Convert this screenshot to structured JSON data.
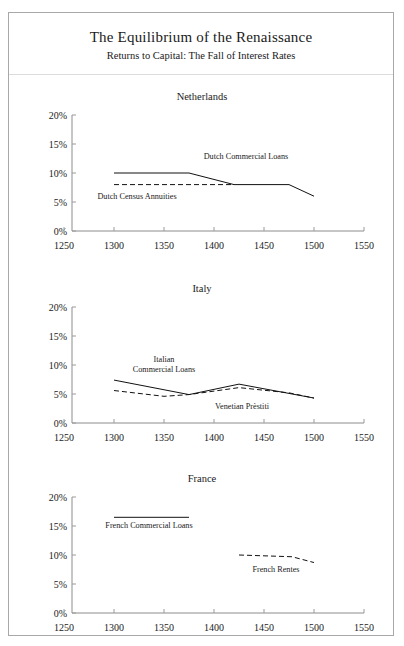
{
  "document": {
    "main_title": "The Equilibrium of the Renaissance",
    "sub_title": "Returns to Capital: The Fall of Interest Rates"
  },
  "axes": {
    "x_ticks": [
      "1250",
      "1300",
      "1350",
      "1400",
      "1450",
      "1500",
      "1550"
    ],
    "y_ticks": [
      "0%",
      "5%",
      "10%",
      "15%",
      "20%"
    ]
  },
  "chart_data": [
    {
      "type": "line",
      "title": "Netherlands",
      "xlabel": "",
      "ylabel": "",
      "xlim": [
        1250,
        1550
      ],
      "ylim": [
        0,
        20
      ],
      "xticks": [
        1250,
        1300,
        1350,
        1400,
        1450,
        1500,
        1550
      ],
      "yticks": [
        0,
        5,
        10,
        15,
        20
      ],
      "xticklabels": [
        "1250",
        "1300",
        "1350",
        "1400",
        "1450",
        "1500",
        "1550"
      ],
      "yticklabels": [
        "0%",
        "5%",
        "10%",
        "15%",
        "20%"
      ],
      "grid": false,
      "legend": "inline-annotations",
      "series": [
        {
          "name": "Dutch Commercial Loans",
          "style": "solid",
          "label_x": 1432,
          "label_y": 12.4,
          "x": [
            1300,
            1375,
            1420,
            1475,
            1500
          ],
          "y": [
            10.0,
            10.0,
            8.0,
            8.0,
            6.0
          ]
        },
        {
          "name": "Dutch Census Annuities",
          "style": "dashed",
          "label_x": 1323,
          "label_y": 5.6,
          "x": [
            1300,
            1420
          ],
          "y": [
            8.0,
            8.0
          ]
        }
      ]
    },
    {
      "type": "line",
      "title": "Italy",
      "xlabel": "",
      "ylabel": "",
      "xlim": [
        1250,
        1550
      ],
      "ylim": [
        0,
        20
      ],
      "xticks": [
        1250,
        1300,
        1350,
        1400,
        1450,
        1500,
        1550
      ],
      "yticks": [
        0,
        5,
        10,
        15,
        20
      ],
      "xticklabels": [
        "1250",
        "1300",
        "1350",
        "1400",
        "1450",
        "1500",
        "1550"
      ],
      "yticklabels": [
        "0%",
        "5%",
        "10%",
        "15%",
        "20%"
      ],
      "grid": false,
      "legend": "inline-annotations",
      "series": [
        {
          "name": "Italian",
          "name_line2": "Commercial Loans",
          "style": "solid",
          "label_x": 1350,
          "label_y": 10.6,
          "x": [
            1300,
            1375,
            1425,
            1500
          ],
          "y": [
            7.4,
            4.9,
            6.7,
            4.3
          ]
        },
        {
          "name": "Venetian Prèstiti",
          "style": "dashed",
          "label_x": 1428,
          "label_y": 2.5,
          "x": [
            1300,
            1350,
            1375,
            1425,
            1475,
            1500
          ],
          "y": [
            5.6,
            4.6,
            4.9,
            6.1,
            5.2,
            4.3
          ]
        }
      ]
    },
    {
      "type": "line",
      "title": "France",
      "xlabel": "",
      "ylabel": "",
      "xlim": [
        1250,
        1550
      ],
      "ylim": [
        0,
        20
      ],
      "xticks": [
        1250,
        1300,
        1350,
        1400,
        1450,
        1500,
        1550
      ],
      "yticks": [
        0,
        5,
        10,
        15,
        20
      ],
      "xticklabels": [
        "1250",
        "1300",
        "1350",
        "1400",
        "1450",
        "1500",
        "1550"
      ],
      "yticklabels": [
        "0%",
        "5%",
        "10%",
        "15%",
        "20%"
      ],
      "grid": false,
      "legend": "inline-annotations",
      "series": [
        {
          "name": "French Commercial Loans",
          "style": "solid",
          "label_x": 1335,
          "label_y": 14.6,
          "x": [
            1300,
            1375
          ],
          "y": [
            16.5,
            16.5
          ]
        },
        {
          "name": "French Rentes",
          "style": "dashed",
          "label_x": 1462,
          "label_y": 7.1,
          "x": [
            1425,
            1478,
            1500
          ],
          "y": [
            10.0,
            9.7,
            8.7
          ]
        }
      ]
    }
  ]
}
